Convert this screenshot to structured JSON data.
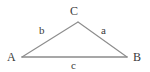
{
  "diagram": {
    "type": "geometry-triangle",
    "background_color": "#ffffff",
    "stroke_color": "#8c8c8c",
    "base_stroke_color": "#8a8a8a",
    "text_color": "#3a3a3a",
    "vertices": [
      {
        "id": "A",
        "label": "A",
        "x": 22,
        "y": 57
      },
      {
        "id": "B",
        "label": "B",
        "x": 127,
        "y": 57
      },
      {
        "id": "C",
        "label": "C",
        "x": 78,
        "y": 22
      }
    ],
    "sides": [
      {
        "id": "a",
        "label": "a",
        "from": "C",
        "to": "B",
        "opposite_vertex": "A"
      },
      {
        "id": "b",
        "label": "b",
        "from": "A",
        "to": "C",
        "opposite_vertex": "B"
      },
      {
        "id": "c",
        "label": "c",
        "from": "A",
        "to": "B",
        "opposite_vertex": "C"
      }
    ],
    "labels": {
      "vertex_A": "A",
      "vertex_B": "B",
      "vertex_C": "C",
      "side_a": "a",
      "side_b": "b",
      "side_c": "c"
    }
  }
}
